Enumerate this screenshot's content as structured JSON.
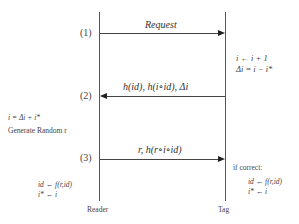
{
  "participants": {
    "reader": {
      "label": "Reader"
    },
    "tag": {
      "label": "Tag"
    }
  },
  "steps": [
    {
      "number": "(1)",
      "message": "Request",
      "direction": "reader-to-tag"
    },
    {
      "number": "(2)",
      "message": "h(id), h(i∘id), Δi",
      "direction": "tag-to-reader"
    },
    {
      "number": "(3)",
      "message": "r, h(r∘i∘id)",
      "direction": "reader-to-tag"
    }
  ],
  "notes": {
    "tag_after_1": [
      "i ← i + 1",
      "Δi = i − i*"
    ],
    "reader_after_2": [
      "i = Δi + i*",
      "Generate Random r"
    ],
    "reader_after_3": [
      "id ← f(r,id)",
      "i* ← i"
    ],
    "tag_after_3": {
      "condition": "if correct:",
      "lines": [
        "id ← f(r,id)",
        "i* ← i"
      ]
    }
  }
}
